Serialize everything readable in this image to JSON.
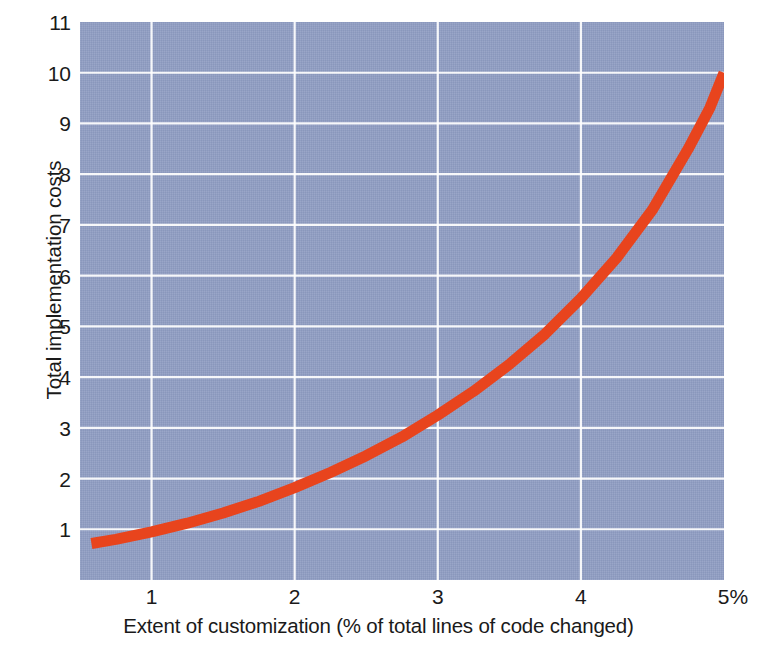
{
  "chart_data": {
    "type": "line",
    "title": "",
    "xlabel": "Extent of customization (% of total lines of code changed)",
    "ylabel": "Total implementation costs",
    "xlim": [
      0.5,
      5.0
    ],
    "ylim": [
      0,
      11
    ],
    "xticks": [
      "1",
      "2",
      "3",
      "4",
      "5%"
    ],
    "xtick_values": [
      1,
      2,
      3,
      4,
      5
    ],
    "yticks": [
      "1",
      "2",
      "3",
      "4",
      "5",
      "6",
      "7",
      "8",
      "9",
      "10",
      "11"
    ],
    "ytick_values": [
      1,
      2,
      3,
      4,
      5,
      6,
      7,
      8,
      9,
      10,
      11
    ],
    "grid": true,
    "legend": "none",
    "series": [
      {
        "name": "Total implementation costs",
        "color": "#e8441d",
        "x": [
          0.58,
          0.75,
          1.0,
          1.25,
          1.5,
          1.75,
          2.0,
          2.25,
          2.5,
          2.75,
          3.0,
          3.25,
          3.5,
          3.75,
          4.0,
          4.25,
          4.5,
          4.75,
          4.9,
          5.0
        ],
        "y": [
          0.72,
          0.8,
          0.95,
          1.12,
          1.32,
          1.55,
          1.82,
          2.12,
          2.45,
          2.82,
          3.25,
          3.72,
          4.25,
          4.85,
          5.55,
          6.35,
          7.3,
          8.5,
          9.3,
          10.0
        ]
      }
    ],
    "colors": {
      "plot_background": "#8f9dc3",
      "gridline": "#ffffff",
      "curve": "#e8441d",
      "text": "#1a1a1a",
      "page_background": "#ffffff"
    }
  },
  "axes": {
    "y_title": "Total implementation costs",
    "x_title": "Extent of customization (% of total lines of code changed)",
    "y_tick_labels": [
      "11",
      "10",
      "9",
      "8",
      "7",
      "6",
      "5",
      "4",
      "3",
      "2",
      "1"
    ],
    "x_tick_labels": [
      "1",
      "2",
      "3",
      "4",
      "5%"
    ]
  }
}
